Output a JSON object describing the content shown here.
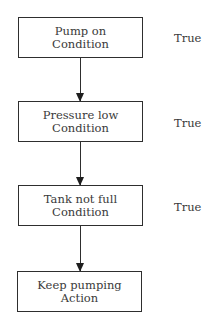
{
  "diagram": {
    "type": "flowchart",
    "nodes": [
      {
        "title": "Pump on",
        "kind": "Condition",
        "result": "True"
      },
      {
        "title": "Pressure low",
        "kind": "Condition",
        "result": "True"
      },
      {
        "title": "Tank not full",
        "kind": "Condition",
        "result": "True"
      },
      {
        "title": "Keep pumping",
        "kind": "Action"
      }
    ],
    "edges": [
      {
        "from": 0,
        "to": 1
      },
      {
        "from": 1,
        "to": 2
      },
      {
        "from": 2,
        "to": 3
      }
    ]
  }
}
